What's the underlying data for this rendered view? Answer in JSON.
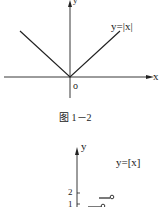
{
  "figure1": {
    "function_label": "y=|x|",
    "x_axis_label": "x",
    "y_axis_label": "y",
    "origin_label": "o",
    "caption": "图 1－2"
  },
  "figure2": {
    "function_label": "y=[x]",
    "y_axis_label": "y",
    "y_ticks": [
      "2",
      "1"
    ]
  },
  "colors": {
    "line": "#222222",
    "background": "#ffffff"
  }
}
